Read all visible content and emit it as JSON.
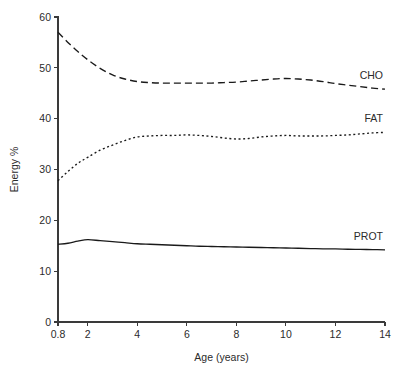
{
  "chart_data": {
    "type": "line",
    "title": "",
    "xlabel": "Age (years)",
    "ylabel": "Energy %",
    "xlim": [
      0.8,
      14
    ],
    "ylim": [
      0,
      60
    ],
    "grid": false,
    "legend_position": "right-inline-labels",
    "x_ticks": [
      "0.8",
      "2",
      "4",
      "6",
      "8",
      "10",
      "12",
      "14"
    ],
    "x_tick_values": [
      0.8,
      2,
      4,
      6,
      8,
      10,
      12,
      14
    ],
    "y_ticks": [
      "0",
      "10",
      "20",
      "30",
      "40",
      "50",
      "60"
    ],
    "y_tick_values": [
      0,
      10,
      20,
      30,
      40,
      50,
      60
    ],
    "x": [
      0.8,
      1.2,
      1.6,
      2.0,
      2.5,
      3.0,
      3.5,
      4.0,
      4.5,
      5.0,
      5.5,
      6.0,
      6.5,
      7.0,
      7.5,
      8.0,
      8.5,
      9.0,
      9.5,
      10.0,
      10.5,
      11.0,
      11.5,
      12.0,
      12.5,
      13.0,
      13.5,
      14.0
    ],
    "series": [
      {
        "name": "CHO",
        "label": "CHO",
        "style": "dashed",
        "color": "#1a1a1a",
        "values": [
          57.0,
          55.0,
          53.2,
          51.6,
          49.9,
          48.6,
          47.8,
          47.3,
          47.1,
          47.0,
          47.0,
          47.0,
          47.0,
          47.0,
          47.1,
          47.2,
          47.4,
          47.6,
          47.8,
          47.9,
          47.8,
          47.6,
          47.3,
          46.9,
          46.6,
          46.3,
          46.0,
          45.8
        ]
      },
      {
        "name": "FAT",
        "label": "FAT",
        "style": "dotted",
        "color": "#1a1a1a",
        "values": [
          27.8,
          29.6,
          31.2,
          32.4,
          33.8,
          34.8,
          35.7,
          36.4,
          36.6,
          36.7,
          36.7,
          36.8,
          36.7,
          36.5,
          36.2,
          36.0,
          36.1,
          36.4,
          36.6,
          36.7,
          36.6,
          36.6,
          36.6,
          36.7,
          36.8,
          37.0,
          37.2,
          37.3
        ]
      },
      {
        "name": "PROT",
        "label": "PROT",
        "style": "solid",
        "color": "#1a1a1a",
        "values": [
          15.3,
          15.5,
          15.9,
          16.2,
          16.0,
          15.8,
          15.6,
          15.4,
          15.3,
          15.2,
          15.1,
          15.0,
          14.9,
          14.85,
          14.8,
          14.75,
          14.7,
          14.65,
          14.6,
          14.55,
          14.5,
          14.45,
          14.4,
          14.38,
          14.32,
          14.28,
          14.24,
          14.2
        ]
      }
    ]
  }
}
